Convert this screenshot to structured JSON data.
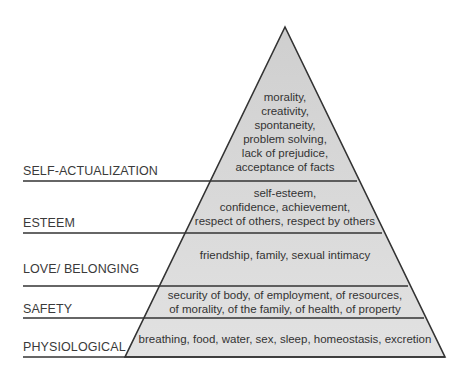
{
  "colors": {
    "fill": "#d6d6d6",
    "line": "#333333",
    "text": "#333333",
    "background": "#ffffff"
  },
  "levels": [
    {
      "label": "SELF-ACTUALIZATION",
      "lines": [
        "morality,",
        "creativity,",
        "spontaneity,",
        "problem solving,",
        "lack of prejudice,",
        "acceptance of facts"
      ]
    },
    {
      "label": "ESTEEM",
      "lines": [
        "self-esteem,",
        "confidence, achievement,",
        "respect of others, respect by others"
      ]
    },
    {
      "label": "LOVE/ BELONGING",
      "lines": [
        "friendship, family, sexual intimacy"
      ]
    },
    {
      "label": "SAFETY",
      "lines": [
        "security of body, of employment, of resources,",
        "of morality, of the family, of health, of property"
      ]
    },
    {
      "label": "PHYSIOLOGICAL",
      "lines": [
        "breathing, food, water, sex, sleep, homeostasis, excretion"
      ]
    }
  ]
}
